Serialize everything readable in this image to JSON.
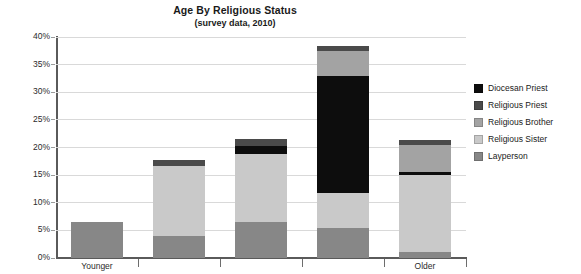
{
  "chart_data": {
    "type": "bar",
    "title": "Age By Religious Status",
    "subtitle": "(survey data, 2010)",
    "stacked": true,
    "xlabel": "",
    "ylabel": "",
    "ylim": [
      0,
      40
    ],
    "ytick_labels": [
      "0%",
      "5%",
      "10%",
      "15%",
      "20%",
      "25%",
      "30%",
      "35%",
      "40%"
    ],
    "ytick_values": [
      0,
      5,
      10,
      15,
      20,
      25,
      30,
      35,
      40
    ],
    "grid": true,
    "legend_position": "right",
    "categories": [
      "Younger",
      "",
      "",
      "",
      "Older"
    ],
    "xtick_labels": [
      "Younger",
      "Older"
    ],
    "series": [
      {
        "name": "Layperson",
        "color": "#878787",
        "values": [
          6.5,
          4.0,
          6.5,
          5.5,
          1.0
        ]
      },
      {
        "name": "Religious Sister",
        "color": "#c9c9c9",
        "values": [
          0,
          12.7,
          12.3,
          6.3,
          14.0
        ]
      },
      {
        "name": "Diocesan Priest",
        "color": "#0d0d0d",
        "values": [
          0,
          0,
          1.5,
          21.2,
          0.6
        ]
      },
      {
        "name": "Religious Brother",
        "color": "#a3a3a3",
        "values": [
          0,
          0,
          0,
          4.5,
          4.9
        ]
      },
      {
        "name": "Religious Priest",
        "color": "#4a4a4a",
        "values": [
          0,
          1.1,
          1.2,
          0.8,
          0.8
        ]
      }
    ],
    "totals": [
      6.5,
      17.8,
      21.5,
      38.3,
      21.3
    ],
    "legend": [
      {
        "label": "Diocesan Priest",
        "color": "#0d0d0d"
      },
      {
        "label": "Religious Priest",
        "color": "#4a4a4a"
      },
      {
        "label": "Religious Brother",
        "color": "#a3a3a3"
      },
      {
        "label": "Religious Sister",
        "color": "#c9c9c9"
      },
      {
        "label": "Layperson",
        "color": "#878787"
      }
    ]
  }
}
